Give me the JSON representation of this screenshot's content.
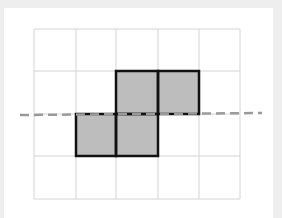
{
  "diagram": {
    "type": "grid-shape-with-line",
    "grid": {
      "cols": 5,
      "rows": 4,
      "x_lines": [
        34,
        76,
        116,
        158,
        199,
        240
      ],
      "y_lines": [
        29,
        71,
        114,
        156,
        199
      ],
      "line_color": "#d4d4d4"
    },
    "shaded_cells": [
      {
        "row": 1,
        "col": 2
      },
      {
        "row": 1,
        "col": 3
      },
      {
        "row": 2,
        "col": 1
      },
      {
        "row": 2,
        "col": 2
      }
    ],
    "shape_fill": "#bdbdbd",
    "shape_stroke": "#111111",
    "dashed_line": {
      "x1": 20,
      "y1": 115,
      "x2": 262,
      "y2": 113,
      "color": "#9a9a9a",
      "dash": "9 5"
    }
  }
}
